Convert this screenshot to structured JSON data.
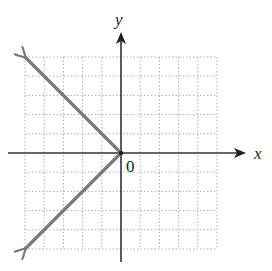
{
  "figure": {
    "x_axis_label": "x",
    "y_axis_label": "y",
    "origin_label": "0"
  },
  "colors": {
    "axis": "#333333",
    "grid": "#b0b0b0",
    "ray": "#7a7a7a",
    "background": "#ffffff"
  },
  "chart_data": {
    "type": "line",
    "title": "",
    "xlabel": "x",
    "ylabel": "y",
    "xlim": [
      -5,
      5
    ],
    "ylim": [
      -5,
      5
    ],
    "grid": true,
    "grid_step": 1,
    "series": [
      {
        "name": "ray-upper-left",
        "points": [
          [
            0,
            0
          ],
          [
            -5,
            5
          ]
        ],
        "arrow_end": true
      },
      {
        "name": "ray-lower-left",
        "points": [
          [
            0,
            0
          ],
          [
            -5,
            -5
          ]
        ],
        "arrow_end": true
      }
    ],
    "annotations": [
      {
        "text": "0",
        "at": [
          0,
          0
        ],
        "position": "below-right"
      }
    ]
  }
}
